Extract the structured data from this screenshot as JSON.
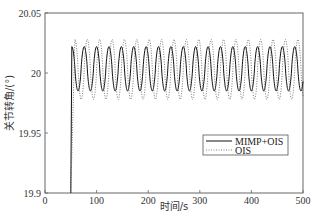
{
  "chart_data": {
    "type": "line",
    "title": "",
    "xlabel": "时间/s",
    "ylabel": "关节转角/(°)",
    "xlim": [
      0,
      500
    ],
    "ylim": [
      19.9,
      20.05
    ],
    "xticks": [
      0,
      100,
      200,
      300,
      400,
      500
    ],
    "yticks": [
      19.9,
      19.95,
      20,
      20.05
    ],
    "xtick_labels": [
      "0",
      "100",
      "200",
      "300",
      "400",
      "500"
    ],
    "ytick_labels": [
      "19.9",
      "19.95",
      "20",
      "20.05"
    ],
    "grid": false,
    "legend_position": "lower right (inside)",
    "step_time": 50,
    "series": [
      {
        "name": "MIMP+OIS",
        "style": "solid",
        "color": "#111111",
        "description": "Jumps from 19.9 to ~20.0 at t≈50 s, then oscillates with period ≈24 s",
        "mean": 20.0,
        "peak": 20.022,
        "trough": 19.985,
        "period": 24,
        "phase_start": 52
      },
      {
        "name": "OIS",
        "style": "dotted",
        "color": "#555555",
        "description": "Jumps at t≈50 s, oscillates with period ≈24 s, larger amplitude, phase-shifted",
        "mean": 20.003,
        "peak": 20.028,
        "trough": 19.978,
        "period": 24,
        "phase_start": 58
      }
    ]
  },
  "legend": {
    "items": [
      {
        "label": "MIMP+OIS"
      },
      {
        "label": "OIS"
      }
    ]
  },
  "axes": {
    "xlabel": "时间/s",
    "ylabel": "关节转角/(°)"
  }
}
